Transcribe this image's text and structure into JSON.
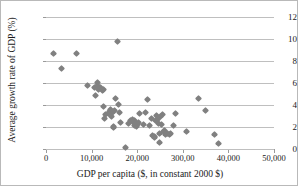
{
  "chart_data": {
    "type": "scatter",
    "title": "",
    "xlabel": "GDP per capita ($, in constant 2000 $)",
    "ylabel": "Average growth rate of GDP (%)",
    "xlim": [
      0,
      50000
    ],
    "ylim": [
      0,
      12
    ],
    "xticks": [
      0,
      10000,
      20000,
      30000,
      40000,
      50000
    ],
    "xticklabels": [
      "0",
      "10,000",
      "20,000",
      "300,00",
      "40,000",
      "50,000"
    ],
    "yticks": [
      0,
      2,
      4,
      6,
      8,
      10,
      12
    ],
    "yticklabels": [
      "0",
      "2",
      "4",
      "6",
      "8",
      "10",
      "12"
    ],
    "grid": "horizontal",
    "legend": "none",
    "marker": "diamond",
    "marker_color": "#808080",
    "series": [
      {
        "name": "Countries",
        "points": [
          [
            1700,
            8.65
          ],
          [
            3300,
            7.3
          ],
          [
            6700,
            8.7
          ],
          [
            9100,
            5.75
          ],
          [
            10700,
            5.55
          ],
          [
            10900,
            4.85
          ],
          [
            11200,
            6.05
          ],
          [
            11300,
            5.8
          ],
          [
            11500,
            5.45
          ],
          [
            11900,
            5.55
          ],
          [
            12300,
            5.3
          ],
          [
            12500,
            5.45
          ],
          [
            12700,
            3.85
          ],
          [
            12900,
            2.8
          ],
          [
            13100,
            3.1
          ],
          [
            13600,
            3.2
          ],
          [
            14000,
            3.45
          ],
          [
            14200,
            3.6
          ],
          [
            14300,
            2.95
          ],
          [
            14500,
            3.35
          ],
          [
            14700,
            2.05
          ],
          [
            14800,
            1.95
          ],
          [
            15100,
            3.5
          ],
          [
            15300,
            4.6
          ],
          [
            15600,
            9.8
          ],
          [
            15900,
            4.05
          ],
          [
            16100,
            3.35
          ],
          [
            16300,
            2.4
          ],
          [
            17400,
            0.1
          ],
          [
            18100,
            2.3
          ],
          [
            18600,
            2.6
          ],
          [
            18900,
            2.7
          ],
          [
            19100,
            2.45
          ],
          [
            19300,
            2.15
          ],
          [
            19400,
            2.55
          ],
          [
            19600,
            2.3
          ],
          [
            19800,
            2.05
          ],
          [
            20000,
            2.2
          ],
          [
            20300,
            2.4
          ],
          [
            20600,
            3.25
          ],
          [
            21400,
            2.2
          ],
          [
            21900,
            3.3
          ],
          [
            22300,
            4.5
          ],
          [
            22600,
            2.1
          ],
          [
            23100,
            2.75
          ],
          [
            23400,
            1.25
          ],
          [
            23700,
            1.05
          ],
          [
            23900,
            1.15
          ],
          [
            24100,
            2.55
          ],
          [
            24300,
            3.05
          ],
          [
            24400,
            2.7
          ],
          [
            24600,
            2.35
          ],
          [
            24800,
            1.45
          ],
          [
            24900,
            0.55
          ],
          [
            25100,
            2.95
          ],
          [
            25300,
            2.25
          ],
          [
            25500,
            3.15
          ],
          [
            25700,
            1.55
          ],
          [
            26000,
            1.65
          ],
          [
            26300,
            1.35
          ],
          [
            26700,
            1.4
          ],
          [
            27100,
            1.3
          ],
          [
            27400,
            1.45
          ],
          [
            27900,
            2.1
          ],
          [
            28300,
            3.25
          ],
          [
            30900,
            1.55
          ],
          [
            33500,
            4.6
          ],
          [
            34900,
            3.5
          ],
          [
            36900,
            1.35
          ],
          [
            37900,
            0.5
          ]
        ]
      }
    ]
  }
}
